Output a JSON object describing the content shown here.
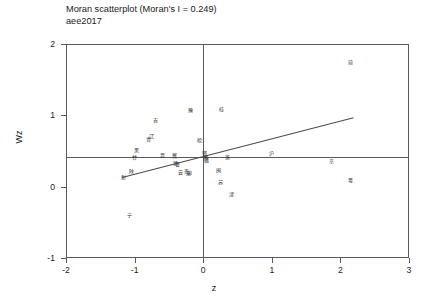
{
  "chart_data": {
    "type": "scatter",
    "title": "Moran scatterplot (Moran's I = 0.249)",
    "subtitle": "aee2017",
    "xlabel": "z",
    "ylabel": "Wz",
    "xlim": [
      -2,
      3
    ],
    "ylim": [
      -1,
      2
    ],
    "xticks": [
      "-2",
      "-1",
      "0",
      "1",
      "2",
      "3"
    ],
    "xtick_values": [
      -2,
      -1,
      0,
      1,
      2,
      3
    ],
    "yticks": [
      "-1",
      "0",
      "1",
      "2"
    ],
    "ytick_values": [
      -1,
      0,
      1,
      2
    ],
    "grid": false,
    "legend": null,
    "morans_i": 0.249,
    "reference_lines": {
      "horizontal_mean_wz": 0.42,
      "vertical_mean_z": 0.0,
      "regression": {
        "slope": 0.249,
        "intercept": 0.42,
        "x_start": -1.18,
        "x_end": 2.2,
        "y_start": 0.13,
        "y_end": 0.97
      }
    },
    "points": [
      {
        "label": "新",
        "z": -1.16,
        "wz": 0.13
      },
      {
        "label": "陕",
        "z": -1.04,
        "wz": 0.22
      },
      {
        "label": "甘",
        "z": -1.0,
        "wz": 0.41
      },
      {
        "label": "黑",
        "z": -0.98,
        "wz": 0.51
      },
      {
        "label": "宁",
        "z": -1.08,
        "wz": -0.4
      },
      {
        "label": "青",
        "z": -0.8,
        "wz": 0.67
      },
      {
        "label": "辽",
        "z": -0.76,
        "wz": 0.71
      },
      {
        "label": "吉",
        "z": -0.7,
        "wz": 0.93
      },
      {
        "label": "晋",
        "z": -0.6,
        "wz": 0.44
      },
      {
        "label": "冀",
        "z": -0.42,
        "wz": 0.44
      },
      {
        "label": "蒙",
        "z": -0.41,
        "wz": 0.33
      },
      {
        "label": "鲁",
        "z": -0.38,
        "wz": 0.32
      },
      {
        "label": "云",
        "z": -0.33,
        "wz": 0.2
      },
      {
        "label": "贵",
        "z": -0.24,
        "wz": 0.22
      },
      {
        "label": "川",
        "z": -0.2,
        "wz": 0.2
      },
      {
        "label": "渝",
        "z": -0.22,
        "wz": 0.19
      },
      {
        "label": "豫",
        "z": -0.18,
        "wz": 1.08
      },
      {
        "label": "皖",
        "z": -0.06,
        "wz": 0.66
      },
      {
        "label": "鄂",
        "z": 0.02,
        "wz": 0.47
      },
      {
        "label": "湘",
        "z": 0.03,
        "wz": 0.41
      },
      {
        "label": "赣",
        "z": 0.05,
        "wz": 0.38
      },
      {
        "label": "桂",
        "z": 0.26,
        "wz": 1.09
      },
      {
        "label": "闽",
        "z": 0.22,
        "wz": 0.23
      },
      {
        "label": "苏",
        "z": 0.25,
        "wz": 0.07
      },
      {
        "label": "浙",
        "z": 0.36,
        "wz": 0.41
      },
      {
        "label": "津",
        "z": 0.41,
        "wz": -0.1
      },
      {
        "label": "沪",
        "z": 1.0,
        "wz": 0.47
      },
      {
        "label": "京",
        "z": 1.87,
        "wz": 0.36
      },
      {
        "label": "粤",
        "z": 2.15,
        "wz": 0.1
      },
      {
        "label": "琼",
        "z": 2.15,
        "wz": 1.75
      }
    ]
  }
}
